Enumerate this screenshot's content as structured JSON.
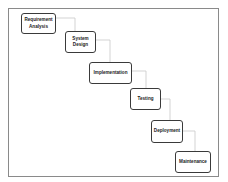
{
  "diagram": {
    "type": "waterfall",
    "stages": [
      {
        "label": "Requirement\nAnalysis"
      },
      {
        "label": "System\nDesign"
      },
      {
        "label": "Implementation"
      },
      {
        "label": "Testing"
      },
      {
        "label": "Deployment"
      },
      {
        "label": "Maintenance"
      }
    ],
    "colors": {
      "box_border": "#3a3a3a",
      "connector": "#c8c8c8",
      "frame": "#8a8a8a",
      "text": "#222222"
    }
  }
}
